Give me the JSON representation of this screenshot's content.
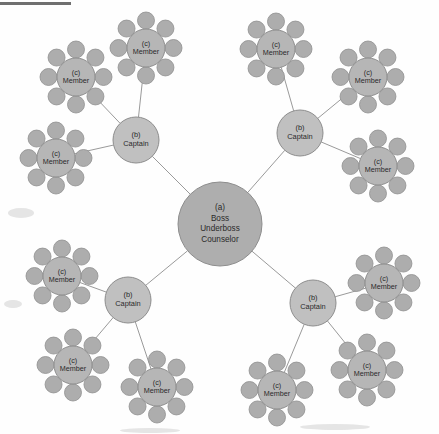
{
  "figure": {
    "name": "organizational-network-diagram",
    "type": "radial hierarchy",
    "background_color": "#fefefe",
    "top_rule": {
      "visible": true,
      "color": "#6f6f6f",
      "x": 0,
      "y": 2,
      "width": 71,
      "height": 3
    }
  },
  "palette": {
    "center_fill": "#aeaeae",
    "captain_fill": "#c0c0c0",
    "member_fill": "#b6b6b6",
    "satellite_fill": "#adadad",
    "node_stroke": "#8d8d8d",
    "edge_stroke": "#9a9a9a",
    "label_color": "#2a2a2a"
  },
  "legend_keys": {
    "a": "(a)",
    "b": "(b)",
    "c": "(c)"
  },
  "center": {
    "id": "boss-node",
    "key": "(a)",
    "lines": [
      "(a)",
      "Boss",
      "Underboss",
      "Counselor"
    ],
    "roles": [
      "Boss",
      "Underboss",
      "Counselor"
    ],
    "cx": 220,
    "cy": 224,
    "r": 42
  },
  "captains": [
    {
      "id": "captain-top-left",
      "key": "(b)",
      "label": "Captain",
      "cx": 136,
      "cy": 140,
      "r": 23
    },
    {
      "id": "captain-top-right",
      "key": "(b)",
      "label": "Captain",
      "cx": 300,
      "cy": 133,
      "r": 23
    },
    {
      "id": "captain-bottom-left",
      "key": "(b)",
      "label": "Captain",
      "cx": 128,
      "cy": 300,
      "r": 23
    },
    {
      "id": "captain-bottom-right",
      "key": "(b)",
      "label": "Captain",
      "cx": 313,
      "cy": 303,
      "r": 23
    }
  ],
  "members": [
    {
      "id": "member-tl-1",
      "key": "(c)",
      "label": "Member",
      "cx": 76,
      "cy": 77,
      "r": 19,
      "parent": "captain-top-left"
    },
    {
      "id": "member-tl-2",
      "key": "(c)",
      "label": "Member",
      "cx": 146,
      "cy": 48,
      "r": 19,
      "parent": "captain-top-left"
    },
    {
      "id": "member-tl-3",
      "key": "(c)",
      "label": "Member",
      "cx": 56,
      "cy": 158,
      "r": 19,
      "parent": "captain-top-left"
    },
    {
      "id": "member-tr-1",
      "key": "(c)",
      "label": "Member",
      "cx": 276,
      "cy": 49,
      "r": 19,
      "parent": "captain-top-right"
    },
    {
      "id": "member-tr-2",
      "key": "(c)",
      "label": "Member",
      "cx": 368,
      "cy": 77,
      "r": 19,
      "parent": "captain-top-right"
    },
    {
      "id": "member-tr-3",
      "key": "(c)",
      "label": "Member",
      "cx": 378,
      "cy": 166,
      "r": 19,
      "parent": "captain-top-right"
    },
    {
      "id": "member-bl-1",
      "key": "(c)",
      "label": "Member",
      "cx": 62,
      "cy": 276,
      "r": 19,
      "parent": "captain-bottom-left"
    },
    {
      "id": "member-bl-2",
      "key": "(c)",
      "label": "Member",
      "cx": 73,
      "cy": 365,
      "r": 19,
      "parent": "captain-bottom-left"
    },
    {
      "id": "member-bl-3",
      "key": "(c)",
      "label": "Member",
      "cx": 157,
      "cy": 387,
      "r": 19,
      "parent": "captain-bottom-left"
    },
    {
      "id": "member-br-1",
      "key": "(c)",
      "label": "Member",
      "cx": 384,
      "cy": 283,
      "r": 19,
      "parent": "captain-bottom-right"
    },
    {
      "id": "member-br-2",
      "key": "(c)",
      "label": "Member",
      "cx": 367,
      "cy": 370,
      "r": 19,
      "parent": "captain-bottom-right"
    },
    {
      "id": "member-br-3",
      "key": "(c)",
      "label": "Member",
      "cx": 277,
      "cy": 390,
      "r": 19,
      "parent": "captain-bottom-right"
    }
  ],
  "satellites": {
    "count_per_member": 8,
    "radius": 8.5,
    "ring_radius": 27.5,
    "start_angle_deg": -90
  },
  "edges": [
    {
      "from": "boss-node",
      "to": "captain-top-left"
    },
    {
      "from": "boss-node",
      "to": "captain-top-right"
    },
    {
      "from": "boss-node",
      "to": "captain-bottom-left"
    },
    {
      "from": "boss-node",
      "to": "captain-bottom-right"
    },
    {
      "from": "captain-top-left",
      "to": "member-tl-1"
    },
    {
      "from": "captain-top-left",
      "to": "member-tl-2"
    },
    {
      "from": "captain-top-left",
      "to": "member-tl-3"
    },
    {
      "from": "captain-top-right",
      "to": "member-tr-1"
    },
    {
      "from": "captain-top-right",
      "to": "member-tr-2"
    },
    {
      "from": "captain-top-right",
      "to": "member-tr-3"
    },
    {
      "from": "captain-bottom-left",
      "to": "member-bl-1"
    },
    {
      "from": "captain-bottom-left",
      "to": "member-bl-2"
    },
    {
      "from": "captain-bottom-left",
      "to": "member-bl-3"
    },
    {
      "from": "captain-bottom-right",
      "to": "member-br-1"
    },
    {
      "from": "captain-bottom-right",
      "to": "member-br-2"
    },
    {
      "from": "captain-bottom-right",
      "to": "member-br-3"
    }
  ],
  "counts": {
    "center_nodes": 1,
    "captain_nodes": 4,
    "member_nodes": 12,
    "satellites_total": 96
  }
}
